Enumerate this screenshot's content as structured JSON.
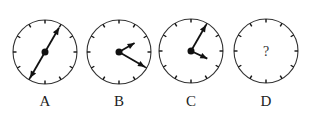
{
  "clocks": [
    {
      "id": "A",
      "label": "A",
      "cx": 45,
      "cy": 52,
      "r": 32,
      "hands": [
        {
          "angle": 30,
          "len": 28
        },
        {
          "angle": 210,
          "len": 30
        }
      ],
      "question": null
    },
    {
      "id": "B",
      "label": "B",
      "cx": 119,
      "cy": 52,
      "r": 32,
      "hands": [
        {
          "angle": 60,
          "len": 18
        },
        {
          "angle": 120,
          "len": 30
        }
      ],
      "question": null
    },
    {
      "id": "C",
      "label": "C",
      "cx": 191,
      "cy": 51,
      "r": 32,
      "hands": [
        {
          "angle": 30,
          "len": 30
        },
        {
          "angle": 115,
          "len": 18
        }
      ],
      "question": null
    },
    {
      "id": "D",
      "label": "D",
      "cx": 266,
      "cy": 51,
      "r": 32,
      "hands": [],
      "question": "?"
    }
  ],
  "labels": {
    "a": "A",
    "b": "B",
    "c": "C",
    "d": "D"
  },
  "question_mark": "?",
  "colors": {
    "stroke": "#333333",
    "hand": "#111111"
  }
}
